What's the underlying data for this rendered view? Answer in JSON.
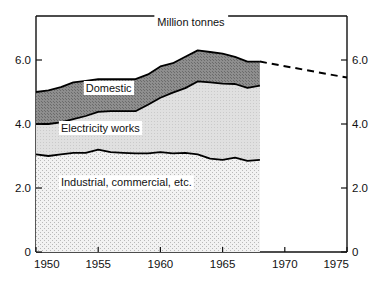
{
  "chart_data": {
    "type": "area",
    "title": "Million tonnes",
    "xlabel": "",
    "ylabel": "Million tonnes",
    "xlim": [
      1950,
      1975
    ],
    "ylim": [
      0,
      7.0
    ],
    "grid": false,
    "legend_position": "inline-labels",
    "x_ticks": [
      "1950",
      "1955",
      "1960",
      "1965",
      "1970",
      "1975"
    ],
    "x_tick_values": [
      1950,
      1955,
      1960,
      1965,
      1970,
      1975
    ],
    "y_ticks_left": [
      "0",
      "2.0",
      "4.0",
      "6.0"
    ],
    "y_ticks_right": [
      "0",
      "2.0",
      "4.0",
      "6.0"
    ],
    "y_tick_values": [
      0,
      2.0,
      4.0,
      6.0
    ],
    "stacked": true,
    "x": [
      1950,
      1951,
      1952,
      1953,
      1954,
      1955,
      1956,
      1957,
      1958,
      1959,
      1960,
      1961,
      1962,
      1963,
      1964,
      1965,
      1966,
      1967,
      1968
    ],
    "series": [
      {
        "name": "Industrial, commercial, etc.",
        "fill": "light-stipple",
        "values": [
          3.05,
          3.0,
          3.05,
          3.1,
          3.1,
          3.2,
          3.12,
          3.1,
          3.08,
          3.08,
          3.12,
          3.08,
          3.1,
          3.05,
          2.92,
          2.88,
          2.95,
          2.85,
          2.88
        ]
      },
      {
        "name": "Electricity works",
        "fill": "light-gray",
        "values": [
          0.95,
          1.0,
          1.0,
          1.05,
          1.15,
          1.18,
          1.28,
          1.3,
          1.32,
          1.52,
          1.7,
          1.9,
          2.02,
          2.28,
          2.38,
          2.38,
          2.3,
          2.28,
          2.32
        ]
      },
      {
        "name": "Domestic",
        "fill": "dark-stipple",
        "values": [
          1.0,
          1.05,
          1.1,
          1.15,
          1.1,
          1.02,
          1.0,
          1.0,
          1.0,
          0.95,
          0.98,
          0.92,
          0.98,
          0.97,
          0.95,
          0.94,
          0.85,
          0.82,
          0.75
        ]
      }
    ],
    "totals": [
      5.0,
      5.05,
      5.15,
      5.3,
      5.35,
      5.4,
      5.4,
      5.4,
      5.4,
      5.55,
      5.8,
      5.9,
      6.1,
      6.3,
      6.25,
      6.2,
      6.1,
      5.95,
      5.95
    ],
    "projection": {
      "label": "projection",
      "style": "dashed",
      "x": [
        1968,
        1975
      ],
      "values": [
        5.95,
        5.45
      ]
    },
    "annotations": [
      {
        "text": "Domestic",
        "x": 1954.0,
        "y": 5.0
      },
      {
        "text": "Electricity works",
        "x": 1952.0,
        "y": 3.75
      },
      {
        "text": "Industrial, commercial, etc.",
        "x": 1952.0,
        "y": 2.05
      },
      {
        "text": "Million tonnes",
        "x": 1965.0,
        "y": 6.75
      }
    ],
    "colors": {
      "axis": "#111111",
      "line": "#000000",
      "domestic_fill": "#8a8a8a",
      "electricity_fill": "#dcdcdc",
      "industrial_fill": "#ececec",
      "background": "#ffffff"
    }
  }
}
